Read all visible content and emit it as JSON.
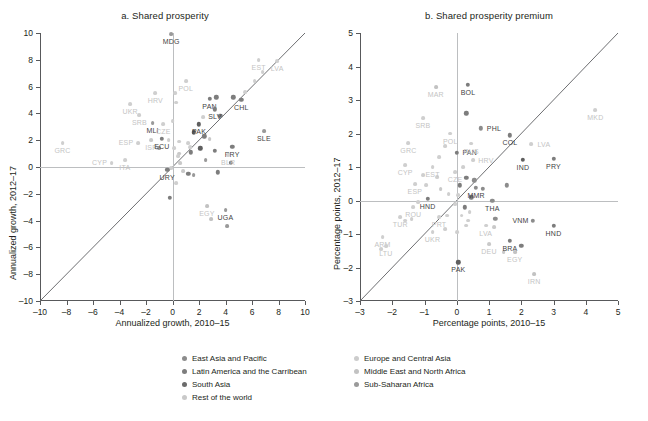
{
  "figure": {
    "panels": [
      {
        "id": "a",
        "title": "a. Shared prosperity",
        "xlabel": "Annualized growth, 2010–15",
        "ylabel": "Annualized growth, 2012–17"
      },
      {
        "id": "b",
        "title": "b. Shared prosperity premium",
        "xlabel": "Percentage points, 2010–15",
        "ylabel": "Percentage points, 2012–17"
      }
    ]
  },
  "legend": {
    "columns": [
      {
        "items": [
          {
            "label": "East Asia and Pacific",
            "color": "#8c8c8c",
            "key": "eap"
          },
          {
            "label": "Latin America and the Carribean",
            "color": "#7d7d7d",
            "key": "lac"
          },
          {
            "label": "South Asia",
            "color": "#6b6b6b",
            "key": "sa"
          },
          {
            "label": "Rest of the world",
            "color": "#c9c9c9",
            "key": "row"
          }
        ]
      },
      {
        "items": [
          {
            "label": "Europe and Central Asia",
            "color": "#cccccc",
            "key": "eca"
          },
          {
            "label": "Middle East and North Africa",
            "color": "#c2c2c2",
            "key": "mena"
          },
          {
            "label": "Sub-Saharan Africa",
            "color": "#9a9a9a",
            "key": "ssa"
          }
        ]
      }
    ]
  },
  "colors": {
    "eap": "#8c8c8c",
    "lac": "#7d7d7d",
    "sa": "#5f5f5f",
    "row": "#c9c9c9",
    "eca": "#cfcfcf",
    "mena": "#c2c2c2",
    "ssa": "#9a9a9a",
    "axis": "#58595b",
    "zero": "#bcbec0",
    "diagonal": "#6d6e71",
    "text": "#231f20",
    "label_light": "#c4c4c4",
    "label_dark": "#3f3f3f"
  },
  "chart_data": [
    {
      "type": "scatter",
      "panel": "a",
      "title": "a. Shared prosperity",
      "xlabel": "Annualized growth, 2010–15",
      "ylabel": "Annualized growth, 2012–17",
      "xlim": [
        -10,
        10
      ],
      "ylim": [
        -10,
        10
      ],
      "xticks": [
        -10,
        -8,
        -6,
        -4,
        -2,
        0,
        2,
        4,
        6,
        8,
        10
      ],
      "yticks": [
        -10,
        -8,
        -6,
        -4,
        -2,
        0,
        2,
        4,
        6,
        8,
        10
      ],
      "grid": false,
      "reference_line": {
        "type": "45-degree",
        "from": [
          -10,
          -10
        ],
        "to": [
          10,
          10
        ]
      },
      "zero_lines": true,
      "points": [
        {
          "label": "GRC",
          "x": -8.3,
          "y": 1.8,
          "group": "eca",
          "label_pos": "above"
        },
        {
          "label": "CYP",
          "x": -4.6,
          "y": 0.3,
          "group": "eca",
          "label_pos": "left"
        },
        {
          "label": "ITA",
          "x": -3.6,
          "y": 0.5,
          "group": "eca",
          "label_pos": "above"
        },
        {
          "label": "UKR",
          "x": -3.2,
          "y": 4.7,
          "group": "eca",
          "label_pos": "above"
        },
        {
          "label": "SRB",
          "x": -2.5,
          "y": 3.9,
          "group": "eca",
          "label_pos": "above"
        },
        {
          "label": "ESP",
          "x": -2.6,
          "y": 1.8,
          "group": "eca",
          "label_pos": "left"
        },
        {
          "label": "HRV",
          "x": -1.3,
          "y": 5.5,
          "group": "eca",
          "label_pos": "above"
        },
        {
          "label": "MLI",
          "x": -1.5,
          "y": 3.3,
          "group": "ssa",
          "label_pos": "above"
        },
        {
          "label": "CZE",
          "x": -0.7,
          "y": 3.2,
          "group": "eca",
          "label_pos": "above"
        },
        {
          "label": "ISR",
          "x": -1.6,
          "y": 2.0,
          "group": "row",
          "label_pos": "above"
        },
        {
          "label": "ECU",
          "x": -0.8,
          "y": 2.1,
          "group": "lac",
          "label_pos": "above"
        },
        {
          "label": "MDG",
          "x": -0.1,
          "y": 9.9,
          "group": "ssa",
          "label_pos": "above"
        },
        {
          "label": "POL",
          "x": 1.0,
          "y": 6.4,
          "group": "eca",
          "label_pos": "above"
        },
        {
          "label": "PAN",
          "x": 2.8,
          "y": 5.1,
          "group": "lac",
          "label_pos": "above"
        },
        {
          "label": "SLV",
          "x": 3.2,
          "y": 4.3,
          "group": "lac",
          "label_pos": "above"
        },
        {
          "label": "PAK",
          "x": 2.0,
          "y": 3.2,
          "group": "sa",
          "label_pos": "above"
        },
        {
          "label": "CHL",
          "x": 5.2,
          "y": 5.0,
          "group": "lac",
          "label_pos": "above"
        },
        {
          "label": "EST",
          "x": 6.5,
          "y": 8.0,
          "group": "eca",
          "label_pos": "above"
        },
        {
          "label": "LVA",
          "x": 7.9,
          "y": 7.9,
          "group": "eca",
          "label_pos": "above"
        },
        {
          "label": "SLE",
          "x": 6.9,
          "y": 2.7,
          "group": "ssa",
          "label_pos": "above"
        },
        {
          "label": "PRY",
          "x": 4.5,
          "y": 1.5,
          "group": "lac",
          "label_pos": "above"
        },
        {
          "label": "BLR",
          "x": 4.2,
          "y": 0.9,
          "group": "eca",
          "label_pos": "above"
        },
        {
          "label": "EGY",
          "x": 2.6,
          "y": -2.9,
          "group": "mena",
          "label_pos": "above"
        },
        {
          "label": "UGA",
          "x": 4.0,
          "y": -3.2,
          "group": "ssa",
          "label_pos": "above"
        },
        {
          "label": "URY",
          "x": -0.4,
          "y": -0.2,
          "group": "lac",
          "label_pos": "above"
        },
        {
          "label": "",
          "x": 6.8,
          "y": 7.1,
          "group": "eca"
        },
        {
          "label": "",
          "x": 6.2,
          "y": 6.4,
          "group": "eca"
        },
        {
          "label": "",
          "x": 5.5,
          "y": 5.6,
          "group": "eca"
        },
        {
          "label": "",
          "x": 4.6,
          "y": 5.2,
          "group": "lac"
        },
        {
          "label": "",
          "x": 3.3,
          "y": 5.2,
          "group": "lac"
        },
        {
          "label": "",
          "x": 0.2,
          "y": 5.5,
          "group": "eca"
        },
        {
          "label": "",
          "x": 0.3,
          "y": 4.8,
          "group": "eca"
        },
        {
          "label": "",
          "x": 3.6,
          "y": 3.8,
          "group": "lac"
        },
        {
          "label": "",
          "x": 2.3,
          "y": 3.7,
          "group": "eca"
        },
        {
          "label": "",
          "x": 0.0,
          "y": 3.4,
          "group": "eca"
        },
        {
          "label": "",
          "x": 1.6,
          "y": 2.6,
          "group": "sa"
        },
        {
          "label": "",
          "x": 2.4,
          "y": 2.3,
          "group": "lac"
        },
        {
          "label": "",
          "x": 2.8,
          "y": 2.1,
          "group": "row"
        },
        {
          "label": "",
          "x": -0.3,
          "y": 2.0,
          "group": "eca"
        },
        {
          "label": "",
          "x": 0.5,
          "y": 1.9,
          "group": "eca"
        },
        {
          "label": "",
          "x": 1.2,
          "y": 1.8,
          "group": "eca"
        },
        {
          "label": "",
          "x": 1.3,
          "y": 1.5,
          "group": "eca"
        },
        {
          "label": "",
          "x": 0.1,
          "y": 1.4,
          "group": "eca"
        },
        {
          "label": "",
          "x": -1.0,
          "y": 1.4,
          "group": "ssa"
        },
        {
          "label": "",
          "x": 2.1,
          "y": 1.4,
          "group": "sa"
        },
        {
          "label": "",
          "x": 3.2,
          "y": 1.2,
          "group": "lac"
        },
        {
          "label": "",
          "x": 1.4,
          "y": 1.1,
          "group": "lac"
        },
        {
          "label": "",
          "x": 0.5,
          "y": 1.0,
          "group": "row"
        },
        {
          "label": "",
          "x": 0.4,
          "y": 0.8,
          "group": "eca"
        },
        {
          "label": "",
          "x": 2.5,
          "y": 0.5,
          "group": "ssa"
        },
        {
          "label": "",
          "x": 0.6,
          "y": 0.3,
          "group": "row"
        },
        {
          "label": "",
          "x": 4.4,
          "y": 0.3,
          "group": "lac"
        },
        {
          "label": "",
          "x": -0.1,
          "y": -0.1,
          "group": "eca"
        },
        {
          "label": "",
          "x": 0.8,
          "y": -0.3,
          "group": "row"
        },
        {
          "label": "",
          "x": 1.2,
          "y": -0.5,
          "group": "lac"
        },
        {
          "label": "",
          "x": 1.6,
          "y": -0.6,
          "group": "ssa"
        },
        {
          "label": "",
          "x": 3.4,
          "y": -0.4,
          "group": "lac"
        },
        {
          "label": "",
          "x": 0.3,
          "y": -1.2,
          "group": "eca"
        },
        {
          "label": "",
          "x": -0.2,
          "y": -2.3,
          "group": "lac"
        },
        {
          "label": "",
          "x": 2.9,
          "y": -3.9,
          "group": "mena"
        },
        {
          "label": "",
          "x": 4.1,
          "y": -4.4,
          "group": "ssa"
        }
      ]
    },
    {
      "type": "scatter",
      "panel": "b",
      "title": "b. Shared prosperity premium",
      "xlabel": "Percentage points, 2010–15",
      "ylabel": "Percentage points, 2012–17",
      "xlim": [
        -3,
        5
      ],
      "ylim": [
        -3,
        5
      ],
      "xticks": [
        -3,
        -2,
        -1,
        0,
        1,
        2,
        3,
        4,
        5
      ],
      "yticks": [
        -3,
        -2,
        -1,
        0,
        1,
        2,
        3,
        4,
        5
      ],
      "grid": false,
      "reference_line": {
        "type": "45-degree",
        "from": [
          -3,
          -3
        ],
        "to": [
          5,
          5
        ]
      },
      "zero_lines": true,
      "points": [
        {
          "label": "MAR",
          "x": -0.65,
          "y": 3.38,
          "group": "mena",
          "label_pos": "above"
        },
        {
          "label": "BOL",
          "x": 0.35,
          "y": 3.45,
          "group": "lac",
          "label_pos": "above"
        },
        {
          "label": "SRB",
          "x": -1.05,
          "y": 2.45,
          "group": "eca",
          "label_pos": "above"
        },
        {
          "label": "PHL",
          "x": 0.75,
          "y": 2.15,
          "group": "eap",
          "label_pos": "right"
        },
        {
          "label": "GRC",
          "x": -1.5,
          "y": 1.72,
          "group": "eca",
          "label_pos": "above"
        },
        {
          "label": "POL",
          "x": -0.2,
          "y": 2.0,
          "group": "eca",
          "label_pos": "above"
        },
        {
          "label": "PAN",
          "x": 0.0,
          "y": 1.42,
          "group": "lac",
          "label_pos": "right"
        },
        {
          "label": "RUS",
          "x": 0.45,
          "y": 1.7,
          "group": "eca",
          "label_pos": "above"
        },
        {
          "label": "COL",
          "x": 1.65,
          "y": 1.95,
          "group": "lac",
          "label_pos": "below"
        },
        {
          "label": "MKD",
          "x": 4.3,
          "y": 2.7,
          "group": "eca",
          "label_pos": "above"
        },
        {
          "label": "LVA",
          "x": 2.3,
          "y": 1.68,
          "group": "eca",
          "label_pos": "right"
        },
        {
          "label": "CYP",
          "x": -1.6,
          "y": 1.05,
          "group": "eca",
          "label_pos": "above"
        },
        {
          "label": "EST",
          "x": -0.75,
          "y": 1.0,
          "group": "eca",
          "label_pos": "above"
        },
        {
          "label": "HRV",
          "x": 0.5,
          "y": 1.2,
          "group": "eca",
          "label_pos": "right"
        },
        {
          "label": "CZE",
          "x": -0.05,
          "y": 0.85,
          "group": "eca",
          "label_pos": "above"
        },
        {
          "label": "IND",
          "x": 2.05,
          "y": 1.22,
          "group": "sa",
          "label_pos": "above"
        },
        {
          "label": "PRY",
          "x": 3.0,
          "y": 1.25,
          "group": "lac",
          "label_pos": "below"
        },
        {
          "label": "ESP",
          "x": -1.3,
          "y": 0.5,
          "group": "eca",
          "label_pos": "above"
        },
        {
          "label": "HND",
          "x": -0.9,
          "y": 0.05,
          "group": "lac",
          "label_pos": "above"
        },
        {
          "label": "MMR",
          "x": 0.6,
          "y": 0.38,
          "group": "eap",
          "label_pos": "above"
        },
        {
          "label": "ROU",
          "x": -1.35,
          "y": -0.2,
          "group": "eca",
          "label_pos": "below"
        },
        {
          "label": "THA",
          "x": 1.1,
          "y": 0.0,
          "group": "eap",
          "label_pos": "below"
        },
        {
          "label": "TUR",
          "x": -1.75,
          "y": -0.5,
          "group": "eca",
          "label_pos": "above"
        },
        {
          "label": "PRT",
          "x": -0.55,
          "y": -0.5,
          "group": "eca",
          "label_pos": "below"
        },
        {
          "label": "VNM",
          "x": 2.35,
          "y": -0.6,
          "group": "eap",
          "label_pos": "left"
        },
        {
          "label": "HND",
          "x": 3.0,
          "y": -0.75,
          "group": "lac",
          "label_pos": "below"
        },
        {
          "label": "UKR",
          "x": -0.75,
          "y": -0.95,
          "group": "eca",
          "label_pos": "below"
        },
        {
          "label": "LVA",
          "x": 0.9,
          "y": -0.75,
          "group": "eca",
          "label_pos": "below"
        },
        {
          "label": "BRA",
          "x": 1.65,
          "y": -1.2,
          "group": "lac",
          "label_pos": "above"
        },
        {
          "label": "DEU",
          "x": 1.0,
          "y": -1.3,
          "group": "row",
          "label_pos": "below"
        },
        {
          "label": "EGY",
          "x": 1.8,
          "y": -1.55,
          "group": "mena",
          "label_pos": "below"
        },
        {
          "label": "PAK",
          "x": 0.05,
          "y": -1.85,
          "group": "sa",
          "label_pos": "below"
        },
        {
          "label": "IRN",
          "x": 2.4,
          "y": -2.2,
          "group": "mena",
          "label_pos": "below"
        },
        {
          "label": "ARM",
          "x": -2.3,
          "y": -1.1,
          "group": "eca",
          "label_pos": "below"
        },
        {
          "label": "LTU",
          "x": -2.2,
          "y": -1.35,
          "group": "eca",
          "label_pos": "below"
        },
        {
          "label": "",
          "x": 0.3,
          "y": 2.6,
          "group": "lac"
        },
        {
          "label": "",
          "x": -0.35,
          "y": 1.62,
          "group": "eca"
        },
        {
          "label": "",
          "x": -0.55,
          "y": 1.3,
          "group": "eca"
        },
        {
          "label": "",
          "x": 0.2,
          "y": 1.0,
          "group": "eca"
        },
        {
          "label": "",
          "x": -1.05,
          "y": 0.75,
          "group": "eca"
        },
        {
          "label": "",
          "x": -0.6,
          "y": 0.7,
          "group": "eca"
        },
        {
          "label": "",
          "x": 0.3,
          "y": 0.68,
          "group": "lac"
        },
        {
          "label": "",
          "x": -0.95,
          "y": 0.45,
          "group": "eca"
        },
        {
          "label": "",
          "x": -0.5,
          "y": 0.35,
          "group": "row"
        },
        {
          "label": "",
          "x": 0.1,
          "y": 0.45,
          "group": "lac"
        },
        {
          "label": "",
          "x": 0.55,
          "y": 0.6,
          "group": "eap"
        },
        {
          "label": "",
          "x": 0.8,
          "y": 0.35,
          "group": "eap"
        },
        {
          "label": "",
          "x": -0.25,
          "y": 0.2,
          "group": "eca"
        },
        {
          "label": "",
          "x": 0.05,
          "y": 0.15,
          "group": "eca"
        },
        {
          "label": "",
          "x": 0.45,
          "y": 0.1,
          "group": "lac"
        },
        {
          "label": "",
          "x": 1.55,
          "y": 0.45,
          "group": "eap"
        },
        {
          "label": "",
          "x": -1.2,
          "y": -0.05,
          "group": "eca"
        },
        {
          "label": "",
          "x": -0.05,
          "y": -0.1,
          "group": "eca"
        },
        {
          "label": "",
          "x": 0.25,
          "y": -0.2,
          "group": "lac"
        },
        {
          "label": "",
          "x": 0.4,
          "y": -0.35,
          "group": "eca"
        },
        {
          "label": "",
          "x": 0.15,
          "y": -0.45,
          "group": "eca"
        },
        {
          "label": "",
          "x": -0.3,
          "y": -0.45,
          "group": "eca"
        },
        {
          "label": "",
          "x": 0.35,
          "y": -0.6,
          "group": "eca"
        },
        {
          "label": "",
          "x": 0.3,
          "y": -0.75,
          "group": "eca"
        },
        {
          "label": "",
          "x": 1.2,
          "y": -0.55,
          "group": "eap"
        },
        {
          "label": "",
          "x": 1.15,
          "y": -0.8,
          "group": "row"
        },
        {
          "label": "",
          "x": -1.4,
          "y": -0.55,
          "group": "eca"
        },
        {
          "label": "",
          "x": -1.6,
          "y": -0.6,
          "group": "eca"
        },
        {
          "label": "",
          "x": -0.35,
          "y": -0.85,
          "group": "eca"
        },
        {
          "label": "",
          "x": 0.0,
          "y": -0.95,
          "group": "eca"
        },
        {
          "label": "",
          "x": 2.0,
          "y": -1.35,
          "group": "lac"
        },
        {
          "label": "",
          "x": 1.45,
          "y": -1.55,
          "group": "row"
        },
        {
          "label": "",
          "x": -2.35,
          "y": -1.45,
          "group": "eca"
        }
      ]
    }
  ]
}
